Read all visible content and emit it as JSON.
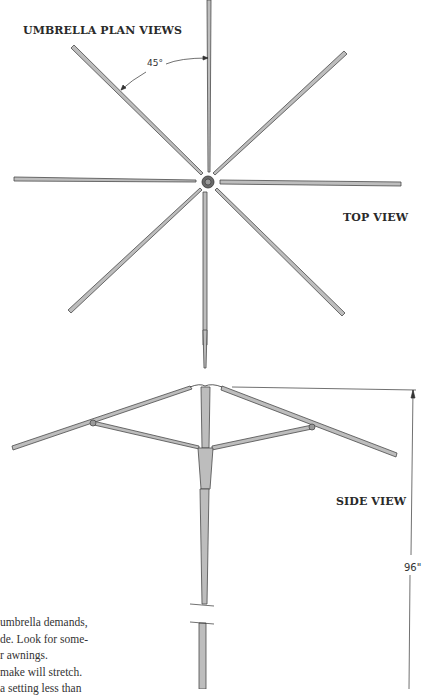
{
  "figure": {
    "title": "UMBRELLA PLAN VIEWS",
    "top_view_label": "TOP VIEW",
    "side_view_label": "SIDE VIEW",
    "angle_annotation": "45°",
    "height_dimension": "96\"",
    "colors": {
      "rib_fill": "#b9b9b9",
      "rib_stroke": "#4a4a4a",
      "text": "#2a2a2a",
      "background": "#ffffff"
    }
  },
  "top_view": {
    "rib_count": 8,
    "angle_between_ribs_deg": 45,
    "hub": "center-hub"
  },
  "side_view": {
    "parts": [
      "ribs",
      "stretchers",
      "runner",
      "pole",
      "break-lines"
    ]
  },
  "body_text": {
    "lines": [
      "umbrella demands,",
      "de. Look for some-",
      "r awnings.",
      " make will stretch.",
      " a setting less than"
    ]
  }
}
